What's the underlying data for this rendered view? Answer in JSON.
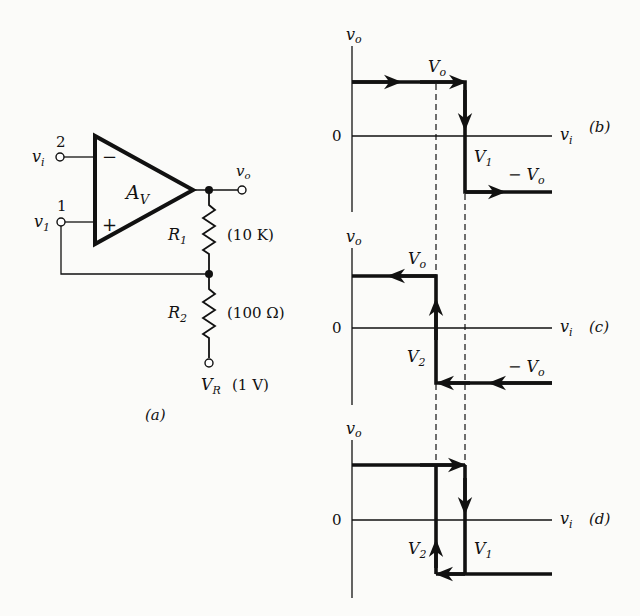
{
  "circuit": {
    "caption": "(a)",
    "amplifier": {
      "gain_label": "A",
      "gain_sub": "V",
      "inverting_sign": "−",
      "noninverting_sign": "+"
    },
    "terminals": {
      "input2": {
        "number": "2",
        "name": "v",
        "sub": "i"
      },
      "input1": {
        "number": "1",
        "name": "v",
        "sub": "1"
      },
      "output": {
        "name": "v",
        "sub": "o"
      },
      "reference": {
        "name": "V",
        "sub": "R",
        "value": "(1 V)"
      }
    },
    "resistors": [
      {
        "name": "R",
        "sub": "1",
        "value": "(10 K)"
      },
      {
        "name": "R",
        "sub": "2",
        "value": "(100 Ω)"
      }
    ]
  },
  "graphs": [
    {
      "id": "b",
      "caption": "(b)",
      "y_axis": {
        "name": "v",
        "sub": "o"
      },
      "x_axis": {
        "name": "v",
        "sub": "i"
      },
      "zero": "0",
      "labels": {
        "top": "V",
        "top_sub": "o",
        "bottom": "− V",
        "bottom_sub": "o",
        "threshold": "V",
        "threshold_sub": "1"
      }
    },
    {
      "id": "c",
      "caption": "(c)",
      "y_axis": {
        "name": "v",
        "sub": "o"
      },
      "x_axis": {
        "name": "v",
        "sub": "i"
      },
      "zero": "0",
      "labels": {
        "top": "V",
        "top_sub": "o",
        "bottom": "− V",
        "bottom_sub": "o",
        "threshold": "V",
        "threshold_sub": "2"
      }
    },
    {
      "id": "d",
      "caption": "(d)",
      "y_axis": {
        "name": "v",
        "sub": "o"
      },
      "x_axis": {
        "name": "v",
        "sub": "i"
      },
      "zero": "0",
      "labels": {
        "threshold_left": "V",
        "threshold_left_sub": "2",
        "threshold_right": "V",
        "threshold_right_sub": "1"
      }
    }
  ]
}
